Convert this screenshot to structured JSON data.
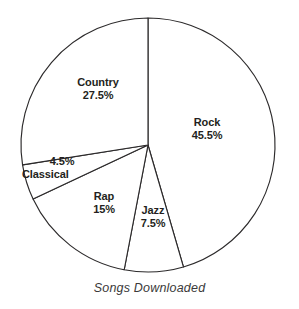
{
  "chart_data": {
    "type": "pie",
    "title": "",
    "caption": "Songs Downloaded",
    "xlabel": "",
    "ylabel": "",
    "grid": false,
    "legend": "none",
    "labels_inside": true,
    "start_angle_deg": 0,
    "direction": "clockwise",
    "center": [
      148,
      145
    ],
    "radius": 127,
    "units": "percent",
    "categories": [
      "Rock",
      "Jazz",
      "Rap",
      "Classical",
      "Country"
    ],
    "values": [
      45.5,
      7.5,
      15,
      4.5,
      27.5
    ],
    "slices": [
      {
        "name": "Rock",
        "value": 45.5,
        "value_label": "45.5%",
        "start_deg": 0,
        "end_deg": 163.8,
        "fill": "#ffffff",
        "stroke": "#2c2a2b"
      },
      {
        "name": "Jazz",
        "value": 7.5,
        "value_label": "7.5%",
        "start_deg": 163.8,
        "end_deg": 190.8,
        "fill": "#ffffff",
        "stroke": "#2c2a2b"
      },
      {
        "name": "Rap",
        "value": 15,
        "value_label": "15%",
        "start_deg": 190.8,
        "end_deg": 244.8,
        "fill": "#ffffff",
        "stroke": "#2c2a2b"
      },
      {
        "name": "Classical",
        "value": 4.5,
        "value_label": "4.5%",
        "start_deg": 244.8,
        "end_deg": 261.0,
        "fill": "#ffffff",
        "stroke": "#2c2a2b"
      },
      {
        "name": "Country",
        "value": 27.5,
        "value_label": "27.5%",
        "start_deg": 261.0,
        "end_deg": 360,
        "fill": "#ffffff",
        "stroke": "#2c2a2b"
      }
    ]
  },
  "colors": {
    "background": "#ffffff",
    "outline": "#2c2a2b",
    "label_text": "#231f20",
    "caption_text": "#3b3a3a"
  }
}
